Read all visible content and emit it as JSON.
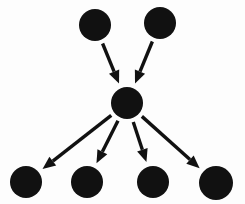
{
  "canvas": {
    "width": 245,
    "height": 204,
    "background_color": "#fdfdfd",
    "title": "Hub and spoke directed node graph"
  },
  "style": {
    "node_color": "#111111",
    "edge_color": "#111111",
    "edge_width": 3.4,
    "arrowhead_length": 13,
    "arrowhead_width": 11
  },
  "chart_data": {
    "type": "diagram",
    "diagram_type": "directed-graph",
    "title": "",
    "xlabel": "",
    "ylabel": "",
    "node_count": 7,
    "edge_count": 6,
    "nodes": [
      {
        "id": "source-left",
        "label": "",
        "cx": 95,
        "cy": 25,
        "r": 16,
        "role": "source"
      },
      {
        "id": "source-right",
        "label": "",
        "cx": 160,
        "cy": 23,
        "r": 16,
        "role": "source"
      },
      {
        "id": "hub",
        "label": "",
        "cx": 127,
        "cy": 103,
        "r": 16,
        "role": "hub"
      },
      {
        "id": "sink-1",
        "label": "",
        "cx": 26,
        "cy": 182,
        "r": 16,
        "role": "sink"
      },
      {
        "id": "sink-2",
        "label": "",
        "cx": 87,
        "cy": 182,
        "r": 16,
        "role": "sink"
      },
      {
        "id": "sink-3",
        "label": "",
        "cx": 153,
        "cy": 182,
        "r": 16,
        "role": "sink"
      },
      {
        "id": "sink-4",
        "label": "",
        "cx": 216,
        "cy": 183,
        "r": 17,
        "role": "sink"
      }
    ],
    "edges": [
      {
        "id": "edge-in-1",
        "from": "source-left",
        "to": "hub",
        "label": "",
        "directed": true
      },
      {
        "id": "edge-in-2",
        "from": "source-right",
        "to": "hub",
        "label": "",
        "directed": true
      },
      {
        "id": "edge-out-1",
        "from": "hub",
        "to": "sink-1",
        "label": "",
        "directed": true
      },
      {
        "id": "edge-out-2",
        "from": "hub",
        "to": "sink-2",
        "label": "",
        "directed": true
      },
      {
        "id": "edge-out-3",
        "from": "hub",
        "to": "sink-3",
        "label": "",
        "directed": true
      },
      {
        "id": "edge-out-4",
        "from": "hub",
        "to": "sink-4",
        "label": "",
        "directed": true
      }
    ]
  }
}
